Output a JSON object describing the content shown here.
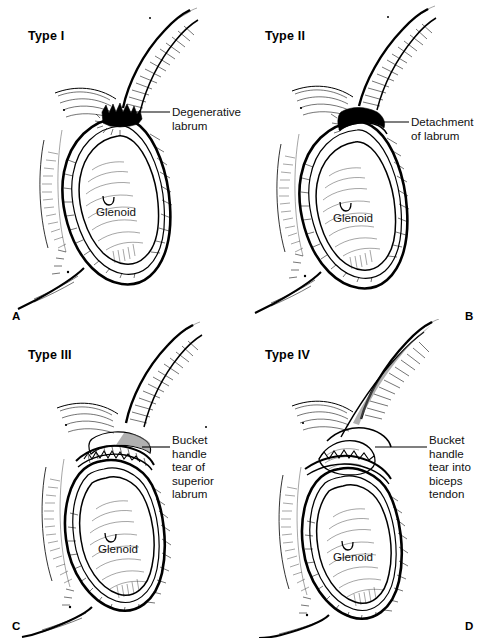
{
  "figure": {
    "type": "medical-illustration",
    "glenoid_label": "Glenoid",
    "panels": [
      {
        "id": "A",
        "letter": "A",
        "type_label": "Type I",
        "callout": "Degenerative\nlabrum",
        "glenoid": "Glenoid",
        "description": "Degenerative fraying of the superior labrum with intact biceps anchor"
      },
      {
        "id": "B",
        "letter": "B",
        "type_label": "Type II",
        "callout": "Detachment\nof labrum",
        "glenoid": "Glenoid",
        "description": "Detachment of the superior labrum and biceps anchor from the glenoid"
      },
      {
        "id": "C",
        "letter": "C",
        "type_label": "Type III",
        "callout": "Bucket handle\ntear of superior\nlabrum",
        "glenoid": "Glenoid",
        "description": "Bucket handle tear of the superior labrum with intact biceps tendon"
      },
      {
        "id": "D",
        "letter": "D",
        "type_label": "Type IV",
        "callout": "Bucket handle\ntear into biceps\ntendon",
        "glenoid": "Glenoid",
        "description": "Bucket handle tear of the superior labrum extending into the biceps tendon"
      }
    ]
  },
  "colors": {
    "background": "#ffffff",
    "ink": "#000000",
    "shading": "#6f6f6f"
  }
}
